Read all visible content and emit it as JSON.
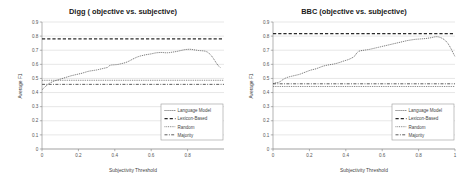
{
  "figure": {
    "background": "#ffffff",
    "panel_count": 2
  },
  "chart_data": [
    {
      "type": "line",
      "title": "Digg ( objective vs. subjective)",
      "xlabel": "Subjectivity Threshold",
      "ylabel": "Average F1",
      "xlim": [
        0,
        1
      ],
      "ylim": [
        0,
        0.9
      ],
      "xticks": [
        0,
        0.2,
        0.4,
        0.6,
        0.8
      ],
      "xtick_labels": [
        "0",
        "0.2",
        "0.4",
        "0.6",
        "0.8"
      ],
      "yticks": [
        0,
        0.1,
        0.2,
        0.3,
        0.4,
        0.5,
        0.6,
        0.7,
        0.8,
        0.9
      ],
      "ytick_labels": [
        "0",
        "0.1",
        "0.2",
        "0.3",
        "0.4",
        "0.5",
        "0.6",
        "0.7",
        "0.8",
        "0.9"
      ],
      "grid": "horizontal",
      "legend_position": "lower-right",
      "series": [
        {
          "name": "Language Model",
          "style": "dotted-marker-line",
          "color": "#4a4a4a",
          "x": [
            0.0,
            0.01,
            0.02,
            0.03,
            0.04,
            0.05,
            0.06,
            0.07,
            0.08,
            0.09,
            0.1,
            0.11,
            0.12,
            0.13,
            0.14,
            0.15,
            0.16,
            0.17,
            0.18,
            0.19,
            0.2,
            0.21,
            0.22,
            0.23,
            0.24,
            0.25,
            0.26,
            0.27,
            0.28,
            0.29,
            0.3,
            0.31,
            0.32,
            0.33,
            0.34,
            0.35,
            0.36,
            0.37,
            0.38,
            0.39,
            0.4,
            0.41,
            0.42,
            0.43,
            0.44,
            0.45,
            0.46,
            0.47,
            0.48,
            0.49,
            0.5,
            0.51,
            0.52,
            0.53,
            0.54,
            0.55,
            0.56,
            0.57,
            0.58,
            0.59,
            0.6,
            0.61,
            0.62,
            0.63,
            0.64,
            0.65,
            0.66,
            0.67,
            0.68,
            0.69,
            0.7,
            0.71,
            0.72,
            0.73,
            0.74,
            0.75,
            0.76,
            0.77,
            0.78,
            0.79,
            0.8,
            0.81,
            0.82,
            0.83,
            0.84,
            0.85,
            0.86,
            0.87,
            0.88,
            0.89,
            0.9,
            0.91,
            0.92,
            0.93,
            0.94,
            0.95,
            0.96,
            0.97,
            0.98
          ],
          "y": [
            0.42,
            0.432,
            0.444,
            0.455,
            0.465,
            0.472,
            0.478,
            0.483,
            0.487,
            0.491,
            0.495,
            0.499,
            0.503,
            0.507,
            0.511,
            0.515,
            0.519,
            0.522,
            0.525,
            0.528,
            0.531,
            0.534,
            0.537,
            0.541,
            0.545,
            0.549,
            0.552,
            0.554,
            0.556,
            0.558,
            0.56,
            0.563,
            0.566,
            0.569,
            0.572,
            0.575,
            0.578,
            0.59,
            0.595,
            0.596,
            0.597,
            0.598,
            0.6,
            0.603,
            0.606,
            0.609,
            0.613,
            0.618,
            0.624,
            0.631,
            0.638,
            0.644,
            0.65,
            0.655,
            0.659,
            0.662,
            0.665,
            0.668,
            0.67,
            0.672,
            0.674,
            0.677,
            0.68,
            0.682,
            0.683,
            0.684,
            0.684,
            0.683,
            0.682,
            0.682,
            0.683,
            0.685,
            0.687,
            0.689,
            0.691,
            0.694,
            0.697,
            0.7,
            0.703,
            0.705,
            0.706,
            0.707,
            0.706,
            0.704,
            0.702,
            0.7,
            0.698,
            0.697,
            0.696,
            0.695,
            0.692,
            0.686,
            0.676,
            0.662,
            0.645,
            0.625,
            0.605,
            0.588,
            0.578
          ]
        },
        {
          "name": "Lexicon-Based",
          "style": "dashed",
          "color": "#2a2a2a",
          "constant": 0.78
        },
        {
          "name": "Random",
          "style": "dotted",
          "color": "#5a5a5a",
          "constant": 0.487
        },
        {
          "name": "Majority",
          "style": "dash-dot",
          "color": "#333333",
          "constant": 0.458
        }
      ]
    },
    {
      "type": "line",
      "title": "BBC (objective vs. subjective)",
      "xlabel": "Subjectivity Threshold",
      "ylabel": "Average F1",
      "xlim": [
        0,
        1
      ],
      "ylim": [
        0,
        0.9
      ],
      "xticks": [
        0,
        0.2,
        0.4,
        0.6,
        0.8,
        1
      ],
      "xtick_labels": [
        "0",
        "0.2",
        "0.4",
        "0.6",
        "0.8",
        "1"
      ],
      "yticks": [
        0,
        0.1,
        0.2,
        0.3,
        0.4,
        0.5,
        0.6,
        0.7,
        0.8,
        0.9
      ],
      "ytick_labels": [
        "0",
        "0.1",
        "0.2",
        "0.3",
        "0.4",
        "0.5",
        "0.6",
        "0.7",
        "0.8",
        "0.9"
      ],
      "grid": "horizontal",
      "legend_position": "lower-right",
      "series": [
        {
          "name": "Language Model",
          "style": "dotted-marker-line",
          "color": "#4a4a4a",
          "x": [
            0.0,
            0.01,
            0.02,
            0.03,
            0.04,
            0.05,
            0.06,
            0.07,
            0.08,
            0.09,
            0.1,
            0.11,
            0.12,
            0.13,
            0.14,
            0.15,
            0.16,
            0.17,
            0.18,
            0.19,
            0.2,
            0.21,
            0.22,
            0.23,
            0.24,
            0.25,
            0.26,
            0.27,
            0.28,
            0.29,
            0.3,
            0.31,
            0.32,
            0.33,
            0.34,
            0.35,
            0.36,
            0.37,
            0.38,
            0.39,
            0.4,
            0.41,
            0.42,
            0.43,
            0.44,
            0.45,
            0.46,
            0.47,
            0.48,
            0.49,
            0.5,
            0.51,
            0.52,
            0.53,
            0.54,
            0.55,
            0.56,
            0.57,
            0.58,
            0.59,
            0.6,
            0.61,
            0.62,
            0.63,
            0.64,
            0.65,
            0.66,
            0.67,
            0.68,
            0.69,
            0.7,
            0.71,
            0.72,
            0.73,
            0.74,
            0.75,
            0.76,
            0.77,
            0.78,
            0.79,
            0.8,
            0.81,
            0.82,
            0.83,
            0.84,
            0.85,
            0.86,
            0.87,
            0.88,
            0.89,
            0.9,
            0.91,
            0.92,
            0.93,
            0.94,
            0.95,
            0.96,
            0.97,
            0.98,
            0.99,
            1.0
          ],
          "y": [
            0.462,
            0.468,
            0.47,
            0.472,
            0.478,
            0.488,
            0.496,
            0.503,
            0.508,
            0.512,
            0.515,
            0.518,
            0.521,
            0.524,
            0.527,
            0.531,
            0.536,
            0.541,
            0.546,
            0.551,
            0.556,
            0.56,
            0.563,
            0.566,
            0.57,
            0.575,
            0.58,
            0.585,
            0.589,
            0.592,
            0.595,
            0.597,
            0.599,
            0.601,
            0.604,
            0.607,
            0.611,
            0.615,
            0.62,
            0.624,
            0.628,
            0.632,
            0.637,
            0.643,
            0.65,
            0.66,
            0.68,
            0.692,
            0.696,
            0.698,
            0.7,
            0.702,
            0.704,
            0.706,
            0.709,
            0.712,
            0.715,
            0.718,
            0.721,
            0.724,
            0.727,
            0.73,
            0.733,
            0.736,
            0.739,
            0.742,
            0.745,
            0.748,
            0.751,
            0.754,
            0.757,
            0.76,
            0.763,
            0.766,
            0.769,
            0.771,
            0.773,
            0.775,
            0.777,
            0.778,
            0.779,
            0.78,
            0.781,
            0.782,
            0.783,
            0.785,
            0.787,
            0.789,
            0.792,
            0.795,
            0.796,
            0.794,
            0.79,
            0.784,
            0.776,
            0.765,
            0.75,
            0.73,
            0.706,
            0.68,
            0.655
          ]
        },
        {
          "name": "Lexicon-Based",
          "style": "dashed",
          "color": "#2a2a2a",
          "constant": 0.818
        },
        {
          "name": "Random",
          "style": "dotted",
          "color": "#5a5a5a",
          "constant": 0.443
        },
        {
          "name": "Majority",
          "style": "dash-dot",
          "color": "#333333",
          "constant": 0.462
        }
      ]
    }
  ]
}
